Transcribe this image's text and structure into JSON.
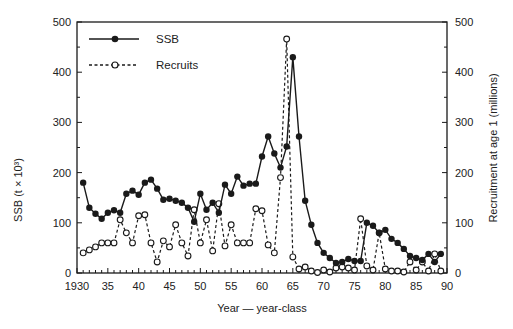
{
  "chart_data": {
    "type": "line",
    "title": "",
    "xlabel": "Year — year-class",
    "ylabel_left": "SSB (t × 10³)",
    "ylabel_right": "Recruitment at age 1 (millions)",
    "xlim": [
      1930,
      1990
    ],
    "ylim_left": [
      0,
      500
    ],
    "ylim_right": [
      0,
      500
    ],
    "x_ticks": [
      1930,
      1935,
      1940,
      1945,
      1950,
      1955,
      1960,
      1965,
      1970,
      1975,
      1980,
      1985,
      1990
    ],
    "x_tick_labels": [
      "1930",
      "35",
      "40",
      "45",
      "50",
      "55",
      "60",
      "65",
      "70",
      "75",
      "80",
      "85",
      "90"
    ],
    "y_ticks_left": [
      0,
      100,
      200,
      300,
      400,
      500
    ],
    "y_ticks_right": [
      0,
      100,
      200,
      300,
      400,
      500
    ],
    "grid": false,
    "legend_position": "upper-left",
    "legend": [
      "SSB",
      "Recruits"
    ],
    "series": [
      {
        "name": "SSB",
        "style": "solid line, filled circle markers",
        "axis": "left",
        "x": [
          1931,
          1932,
          1933,
          1934,
          1935,
          1936,
          1937,
          1938,
          1939,
          1940,
          1941,
          1942,
          1943,
          1944,
          1945,
          1946,
          1947,
          1948,
          1949,
          1950,
          1951,
          1952,
          1953,
          1954,
          1955,
          1956,
          1957,
          1958,
          1959,
          1960,
          1961,
          1962,
          1963,
          1964,
          1965,
          1966,
          1967,
          1968,
          1969,
          1970,
          1971,
          1972,
          1973,
          1974,
          1975,
          1976,
          1977,
          1978,
          1979,
          1980,
          1981,
          1982,
          1983,
          1984,
          1985,
          1986,
          1987,
          1988,
          1989
        ],
        "values": [
          180,
          130,
          118,
          108,
          120,
          125,
          120,
          158,
          164,
          156,
          180,
          186,
          168,
          146,
          148,
          144,
          140,
          130,
          102,
          158,
          126,
          140,
          120,
          176,
          158,
          192,
          174,
          178,
          178,
          232,
          272,
          238,
          210,
          252,
          430,
          272,
          144,
          96,
          60,
          40,
          30,
          20,
          22,
          28,
          24,
          24,
          100,
          94,
          80,
          86,
          68,
          60,
          48,
          34,
          30,
          26,
          38,
          22,
          38
        ]
      },
      {
        "name": "Recruits",
        "style": "dashed line, open circle markers",
        "axis": "right",
        "x": [
          1931,
          1932,
          1933,
          1934,
          1935,
          1936,
          1937,
          1938,
          1939,
          1940,
          1941,
          1942,
          1943,
          1944,
          1945,
          1946,
          1947,
          1948,
          1949,
          1950,
          1951,
          1952,
          1953,
          1954,
          1955,
          1956,
          1957,
          1958,
          1959,
          1960,
          1961,
          1962,
          1963,
          1964,
          1965,
          1966,
          1967,
          1968,
          1969,
          1970,
          1971,
          1972,
          1973,
          1974,
          1975,
          1976,
          1977,
          1978,
          1979,
          1980,
          1981,
          1982,
          1983,
          1984,
          1985,
          1986,
          1987,
          1988,
          1989
        ],
        "values": [
          40,
          46,
          52,
          60,
          60,
          60,
          106,
          80,
          60,
          114,
          116,
          60,
          22,
          64,
          52,
          96,
          60,
          34,
          126,
          60,
          106,
          44,
          138,
          54,
          96,
          60,
          60,
          60,
          128,
          124,
          56,
          40,
          190,
          466,
          32,
          8,
          12,
          4,
          1,
          6,
          2,
          10,
          12,
          10,
          6,
          108,
          14,
          6,
          80,
          8,
          4,
          4,
          2,
          22,
          6,
          22,
          4,
          38,
          4
        ]
      }
    ]
  },
  "axes": {
    "left_title": "SSB (t × 10³)",
    "right_title": "Recruitment at age 1 (millions)",
    "x_title": "Year — year-class"
  },
  "legend": {
    "ssb_label": "SSB",
    "recruits_label": "Recruits"
  },
  "colors": {
    "line": "#1a1a1a",
    "background": "#ffffff"
  }
}
